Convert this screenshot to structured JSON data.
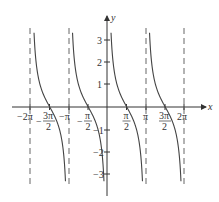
{
  "chart_data": {
    "type": "line",
    "title": "",
    "function": "y = cot(x)",
    "xlabel": "x",
    "ylabel": "y",
    "xlim": [
      -2.6,
      2.6
    ],
    "ylim": [
      -3.5,
      3.5
    ],
    "x_ticks": [
      "-2π",
      "-3π/2",
      "-π",
      "-π/2",
      "π/2",
      "π",
      "3π/2",
      "2π"
    ],
    "y_ticks": [
      "3",
      "2",
      "1",
      "-1",
      "-2",
      "-3"
    ],
    "asymptotes": [
      "-2π",
      "-π",
      "0",
      "π",
      "2π"
    ],
    "grid": false,
    "series": [
      {
        "name": "cot x",
        "branches": [
          "(-2π,-π)",
          "(-π,0)",
          "(0,π)",
          "(π,2π)"
        ],
        "zeros": [
          "-3π/2",
          "-π/2",
          "π/2",
          "3π/2"
        ]
      }
    ]
  },
  "labels": {
    "x": "x",
    "y": "y",
    "xticks": {
      "m2pi": "−2π",
      "m3pi2_num": "3π",
      "m3pi2_den": "2",
      "mpi": "−π",
      "mpi2_num": "π",
      "mpi2_den": "2",
      "pi2_num": "π",
      "pi2_den": "2",
      "pi": "π",
      "p3pi2_num": "3π",
      "p3pi2_den": "2",
      "p2pi": "2π",
      "minus": "−"
    },
    "yticks": {
      "p3": "3",
      "p2": "2",
      "p1": "1",
      "m1": "−1",
      "m2": "−2",
      "m3": "−3"
    }
  }
}
